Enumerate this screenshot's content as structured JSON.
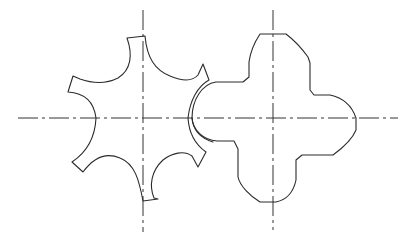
{
  "drawing": {
    "type": "mechanical-line-drawing",
    "description": "Six-tooth star gear meshing with four-lobe rotor",
    "colors": {
      "background": "#ffffff",
      "line": "#2b2b2b",
      "centerline": "#333333"
    },
    "centerlines": {
      "horizontal": {
        "x1": 18,
        "y1": 118,
        "x2": 398,
        "y2": 118
      },
      "left_vertical": {
        "x1": 143,
        "y1": 10,
        "x2": 143,
        "y2": 232
      },
      "right_vertical": {
        "x1": 273,
        "y1": 10,
        "x2": 273,
        "y2": 230
      }
    },
    "left_gear": {
      "name": "six-tooth star gear",
      "center": [
        143,
        118
      ],
      "teeth": 6
    },
    "right_rotor": {
      "name": "four-lobe rotor",
      "center": [
        273,
        118
      ],
      "lobes": 4
    }
  }
}
